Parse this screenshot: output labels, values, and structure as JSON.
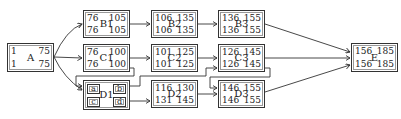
{
  "diagram": {
    "nodes": [
      {
        "id": "A",
        "name": "A",
        "es": "1",
        "ef": "75",
        "ls": "1",
        "lf": "75",
        "x": 7,
        "y": 43,
        "w": 47,
        "h": 29
      },
      {
        "id": "B1",
        "name": "B1",
        "es": "76",
        "ef": "105",
        "ls": "76",
        "lf": "105",
        "x": 83,
        "y": 10,
        "w": 47,
        "h": 28
      },
      {
        "id": "C1",
        "name": "C1",
        "es": "76",
        "ef": "100",
        "ls": "76",
        "lf": "100",
        "x": 83,
        "y": 44,
        "w": 47,
        "h": 28
      },
      {
        "id": "B2",
        "name": "B2",
        "es": "106",
        "ef": "135",
        "ls": "106",
        "lf": "135",
        "x": 151,
        "y": 10,
        "w": 47,
        "h": 28
      },
      {
        "id": "C2",
        "name": "C2",
        "es": "101",
        "ef": "125",
        "ls": "101",
        "lf": "125",
        "x": 151,
        "y": 44,
        "w": 47,
        "h": 28
      },
      {
        "id": "D2",
        "name": "D2",
        "es": "116",
        "ef": "130",
        "ls": "131",
        "lf": "145",
        "x": 151,
        "y": 80,
        "w": 47,
        "h": 28
      },
      {
        "id": "B3",
        "name": "B3",
        "es": "136",
        "ef": "155",
        "ls": "136",
        "lf": "155",
        "x": 218,
        "y": 10,
        "w": 47,
        "h": 28
      },
      {
        "id": "C3",
        "name": "C3",
        "es": "126",
        "ef": "145",
        "ls": "126",
        "lf": "145",
        "x": 218,
        "y": 44,
        "w": 47,
        "h": 28
      },
      {
        "id": "D3",
        "name": "D3",
        "es": "146",
        "ef": "155",
        "ls": "146",
        "lf": "155",
        "x": 218,
        "y": 80,
        "w": 47,
        "h": 28
      },
      {
        "id": "E",
        "name": "E",
        "es": "156",
        "ef": "185",
        "ls": "156",
        "lf": "185",
        "x": 351,
        "y": 43,
        "w": 47,
        "h": 29
      }
    ],
    "composite": {
      "id": "D1",
      "name": "D1",
      "x": 83,
      "y": 80,
      "w": 47,
      "h": 30,
      "parts": [
        {
          "label": "a",
          "x": 3,
          "y": 3
        },
        {
          "label": "b",
          "x": 29,
          "y": 3
        },
        {
          "label": "c",
          "x": 3,
          "y": 16
        },
        {
          "label": "d",
          "x": 29,
          "y": 16
        }
      ]
    },
    "edges": [
      "A->B1",
      "A->C1",
      "A->D1",
      "C1->D1",
      "B1->B2",
      "C1->C2",
      "D1->C3",
      "D1->D2",
      "B2->B3",
      "C2->C3",
      "D2->D3",
      "C3->D3",
      "B3->E",
      "C3->E",
      "D3->E"
    ]
  }
}
